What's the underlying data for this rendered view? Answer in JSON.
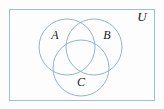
{
  "figure": {
    "kind": "venn-diagram",
    "background_color": "#fdfdfd",
    "stroke_color": "#8fb4d0",
    "label_color": "#1a1a1a",
    "universe": {
      "label": "U",
      "rect": {
        "x": 9,
        "y": 9,
        "width": 146,
        "height": 92
      },
      "label_position": {
        "x": 142,
        "y": 18
      }
    },
    "circles": [
      {
        "name": "set-a",
        "label": "A",
        "cx": 67,
        "cy": 47,
        "r": 28,
        "label_position": {
          "x": 55,
          "y": 36
        }
      },
      {
        "name": "set-b",
        "label": "B",
        "cx": 94,
        "cy": 47,
        "r": 28,
        "label_position": {
          "x": 107,
          "y": 36
        }
      },
      {
        "name": "set-c",
        "label": "C",
        "cx": 81,
        "cy": 68,
        "r": 28,
        "label_position": {
          "x": 81,
          "y": 83
        }
      }
    ]
  }
}
